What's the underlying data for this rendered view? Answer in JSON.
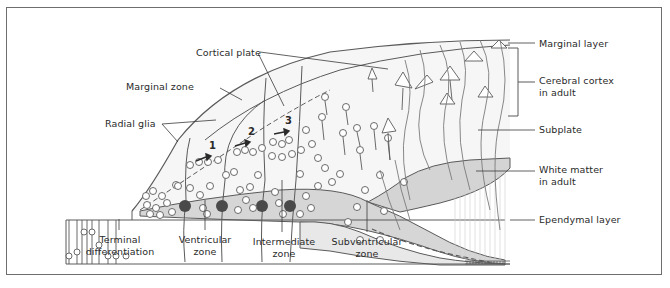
{
  "figure": {
    "colors": {
      "border": "#6e6e6e",
      "line": "#5a5a5a",
      "shaded_zone": "#d2d2d2",
      "light_zone": "#f3f3f3",
      "cell_body": "#4a4a4a",
      "text": "#2a2a2a"
    }
  },
  "labels": {
    "cortical_plate": "Cortical plate",
    "marginal_zone": "Marginal zone",
    "radial_glia": "Radial glia",
    "marginal_layer": "Marginal layer",
    "cerebral_cortex_line1": "Cerebral cortex",
    "cerebral_cortex_line2": "in adult",
    "subplate": "Subplate",
    "white_matter_line1": "White matter",
    "white_matter_line2": "in adult",
    "ependymal_layer": "Ependymal layer",
    "terminal_line1": "Terminal",
    "terminal_line2": "differentiation",
    "ventricular_line1": "Ventricular",
    "ventricular_line2": "zone",
    "intermediate_line1": "Intermediate",
    "intermediate_line2": "zone",
    "subventricular_line1": "Subventricular",
    "subventricular_line2": "zone"
  },
  "migration_steps": [
    "1",
    "2",
    "3"
  ]
}
